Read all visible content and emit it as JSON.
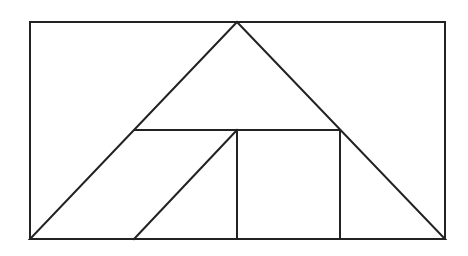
{
  "canvas": {
    "width": 468,
    "height": 256,
    "background": "#ffffff",
    "stroke_color": "#222222",
    "stroke_width": 2
  },
  "figure": {
    "rectangle": {
      "x1": 30,
      "y1": 22,
      "x2": 445,
      "y2": 239
    },
    "triangle": {
      "apex": [
        237,
        22
      ],
      "base_left": [
        30,
        239
      ],
      "base_right": [
        445,
        239
      ]
    },
    "segments": [
      {
        "name": "horizontal-midline",
        "from": [
          135,
          130
        ],
        "to": [
          340,
          130
        ]
      },
      {
        "name": "inner-diagonal",
        "from": [
          237,
          130
        ],
        "to": [
          134,
          239
        ]
      },
      {
        "name": "square-left-edge",
        "from": [
          237,
          130
        ],
        "to": [
          237,
          239
        ]
      },
      {
        "name": "square-right-edge",
        "from": [
          340,
          130
        ],
        "to": [
          340,
          239
        ]
      }
    ]
  }
}
